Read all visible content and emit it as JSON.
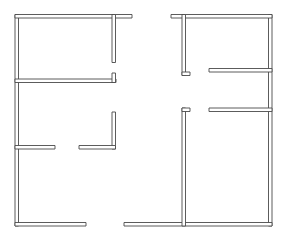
{
  "document": {
    "type": "architectural-floor-plan",
    "title": "Floor Plan",
    "description": "Two-unit monochrome architectural floor plan showing partition walls drawn as thin double-line outlines",
    "canvas": {
      "width": 283,
      "height": 246
    },
    "style": {
      "background_color": "#ffffff",
      "line_color": "#4a4a4a",
      "line_width": 0.9,
      "wall_thickness": 3.5,
      "wall_fill_color": "#ffffff"
    }
  },
  "plan": {
    "units": [
      {
        "name": "left-unit",
        "label": "Left Unit",
        "bounds": {
          "x": 15,
          "y": 14,
          "width": 117,
          "height": 212
        }
      },
      {
        "name": "right-unit",
        "label": "Right Unit",
        "bounds": {
          "x": 171,
          "y": 14,
          "width": 101,
          "height": 212
        }
      }
    ],
    "walls": [
      {
        "name": "left-exterior-wall",
        "label": "Left exterior wall",
        "orientation": "vertical",
        "x": 15.0,
        "y": 14.5,
        "length": 211.5,
        "thickness": 3.5
      },
      {
        "name": "left-unit-top-wall",
        "label": "Left unit top wall",
        "orientation": "horizontal",
        "x": 15.0,
        "y": 14.5,
        "length": 117.0,
        "thickness": 3.5
      },
      {
        "name": "left-unit-bottom-wall",
        "label": "Left unit bottom wall",
        "orientation": "horizontal",
        "x": 15.0,
        "y": 222.5,
        "length": 71.0,
        "thickness": 3.5
      },
      {
        "name": "left-top-partition-vertical",
        "label": "Left top room partition",
        "orientation": "vertical",
        "x": 112.0,
        "y": 14.5,
        "length": 48.0,
        "thickness": 3.5
      },
      {
        "name": "left-middle-partition-horizontal",
        "label": "Left middle partition",
        "orientation": "horizontal",
        "x": 15.0,
        "y": 79.0,
        "length": 101.0,
        "thickness": 3.5
      },
      {
        "name": "left-middle-partition-jamb",
        "label": "Left middle partition door jamb",
        "orientation": "vertical",
        "x": 112.0,
        "y": 73.0,
        "length": 9.5,
        "thickness": 3.5
      },
      {
        "name": "left-lower-l-wall-vertical",
        "label": "Left lower L-wall vertical leg",
        "orientation": "vertical",
        "x": 112.0,
        "y": 112.0,
        "length": 37.0,
        "thickness": 3.5
      },
      {
        "name": "left-lower-l-wall-horizontal",
        "label": "Left lower L-wall horizontal leg",
        "orientation": "horizontal",
        "x": 79.0,
        "y": 145.5,
        "length": 36.5,
        "thickness": 3.5
      },
      {
        "name": "left-lower-stub-wall",
        "label": "Left lower stub wall",
        "orientation": "horizontal",
        "x": 15.0,
        "y": 145.5,
        "length": 40.0,
        "thickness": 3.5
      },
      {
        "name": "right-exterior-wall",
        "label": "Right exterior wall",
        "orientation": "vertical",
        "x": 268.5,
        "y": 14.5,
        "length": 211.5,
        "thickness": 3.5
      },
      {
        "name": "right-unit-top-wall",
        "label": "Right unit top wall",
        "orientation": "horizontal",
        "x": 171.0,
        "y": 14.5,
        "length": 101.0,
        "thickness": 3.5
      },
      {
        "name": "right-unit-bottom-wall",
        "label": "Right unit bottom wall",
        "orientation": "horizontal",
        "x": 124.0,
        "y": 222.5,
        "length": 148.0,
        "thickness": 3.5
      },
      {
        "name": "right-upper-partition-vertical",
        "label": "Right upper room partition",
        "orientation": "vertical",
        "x": 182.0,
        "y": 14.5,
        "length": 61.0,
        "thickness": 3.5
      },
      {
        "name": "right-upper-partition-jamb",
        "label": "Right upper partition door jamb",
        "orientation": "horizontal",
        "x": 182.0,
        "y": 72.0,
        "length": 8.0,
        "thickness": 3.5
      },
      {
        "name": "right-upper-cross-wall",
        "label": "Right upper cross wall",
        "orientation": "horizontal",
        "x": 209.0,
        "y": 68.5,
        "length": 63.0,
        "thickness": 3.5
      },
      {
        "name": "right-middle-cross-wall",
        "label": "Right middle cross wall",
        "orientation": "horizontal",
        "x": 209.0,
        "y": 108.0,
        "length": 63.0,
        "thickness": 3.5
      },
      {
        "name": "right-lower-partition-vertical",
        "label": "Right lower room partition",
        "orientation": "vertical",
        "x": 182.0,
        "y": 108.0,
        "length": 118.0,
        "thickness": 3.5
      },
      {
        "name": "right-lower-partition-jamb",
        "label": "Right lower partition door jamb",
        "orientation": "horizontal",
        "x": 182.0,
        "y": 108.0,
        "length": 8.0,
        "thickness": 3.5
      }
    ],
    "openings": [
      {
        "name": "left-middle-doorway",
        "label": "Left middle doorway",
        "x": 116,
        "y": 79
      },
      {
        "name": "left-lower-doorway",
        "label": "Left lower doorway",
        "x": 58,
        "y": 147
      },
      {
        "name": "left-lower-hall-doorway",
        "label": "Left lower hall doorway",
        "x": 97,
        "y": 147
      },
      {
        "name": "right-upper-doorway",
        "label": "Right upper doorway",
        "x": 196,
        "y": 70
      },
      {
        "name": "right-lower-doorway",
        "label": "Right lower doorway",
        "x": 196,
        "y": 110
      },
      {
        "name": "left-bottom-doorway",
        "label": "Left bottom doorway",
        "x": 100,
        "y": 224
      }
    ]
  }
}
